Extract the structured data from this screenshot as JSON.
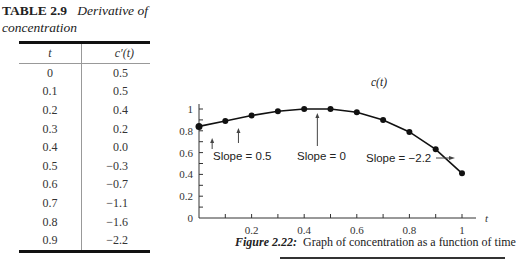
{
  "table": {
    "label": "TABLE 2.9",
    "title": "Derivative of concentration",
    "headers": [
      "t",
      "c′(t)"
    ],
    "rows": [
      [
        "0",
        "0.5"
      ],
      [
        "0.1",
        "0.5"
      ],
      [
        "0.2",
        "0.4"
      ],
      [
        "0.3",
        "0.2"
      ],
      [
        "0.4",
        "0.0"
      ],
      [
        "0.5",
        "−0.3"
      ],
      [
        "0.6",
        "−0.7"
      ],
      [
        "0.7",
        "−1.1"
      ],
      [
        "0.8",
        "−1.6"
      ],
      [
        "0.9",
        "−2.2"
      ]
    ]
  },
  "figure": {
    "number": "Figure 2.22:",
    "caption": "Graph of concentration as a function of time"
  },
  "chart_data": {
    "type": "line",
    "title": "Graph of concentration as a function of time",
    "xlabel": "t",
    "ylabel": "",
    "series": [
      {
        "name": "c(t)",
        "x": [
          0,
          0.1,
          0.2,
          0.3,
          0.4,
          0.5,
          0.6,
          0.7,
          0.8,
          0.9,
          1.0
        ],
        "values": [
          0.84,
          0.89,
          0.94,
          0.98,
          1.0,
          1.0,
          0.97,
          0.9,
          0.79,
          0.63,
          0.41
        ]
      }
    ],
    "xlim": [
      0,
      1
    ],
    "ylim": [
      0,
      1
    ],
    "x_ticks": [
      "0.2",
      "0.4",
      "0.6",
      "0.8",
      "1"
    ],
    "y_ticks": [
      "0",
      "0.2",
      "0.4",
      "0.6",
      "0.8",
      "1"
    ],
    "grid": false,
    "annotations": [
      {
        "text": "Slope = 0.5",
        "points_to_t": [
          0.05,
          0.15
        ]
      },
      {
        "text": "Slope = 0",
        "points_to_t": [
          0.45
        ]
      },
      {
        "text": "Slope = −2.2",
        "points_to_t": [
          1.0
        ]
      },
      {
        "text": "c(t)",
        "label_for": "curve"
      }
    ]
  }
}
